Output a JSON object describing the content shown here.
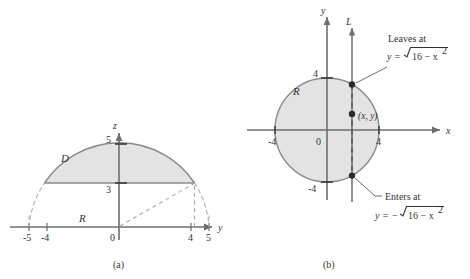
{
  "figure": {
    "panels": [
      {
        "id": "a",
        "caption": "(a)",
        "axes": {
          "horizontal_label": "y",
          "vertical_label": "z",
          "origin_label": "0"
        },
        "tick_labels": {
          "horizontal": [
            "-5",
            "-4",
            "4",
            "5"
          ],
          "vertical": [
            "5",
            "3"
          ]
        },
        "region_labels": [
          {
            "name": "D",
            "text": "D"
          },
          {
            "name": "R",
            "text": "R"
          }
        ]
      },
      {
        "id": "b",
        "caption": "(b)",
        "axes": {
          "horizontal_label": "x",
          "vertical_label": "y",
          "origin_label": "0"
        },
        "tick_labels": {
          "horizontal": [
            "-4",
            "4"
          ],
          "vertical": [
            "4",
            "-4"
          ]
        },
        "region_labels": [
          {
            "name": "R",
            "text": "R"
          }
        ],
        "line_label": "L",
        "point_label": "(x, y)",
        "annotations": [
          {
            "name": "leaves-at",
            "title": "Leaves at",
            "formula_lhs": "y =",
            "formula_sign": "",
            "radicand": "16 − x",
            "exponent": "2"
          },
          {
            "name": "enters-at",
            "title": "Enters at",
            "formula_lhs": "y =",
            "formula_sign": "−",
            "radicand": "16 − x",
            "exponent": "2"
          }
        ]
      }
    ]
  },
  "colors": {
    "shade_fill": "#e3e3e3",
    "curve_stroke": "#808080",
    "axis_stroke": "#6e6e6e",
    "dashed_stroke": "#a8a8a8",
    "text": "#333333",
    "point_fill": "#2b2b2b"
  }
}
